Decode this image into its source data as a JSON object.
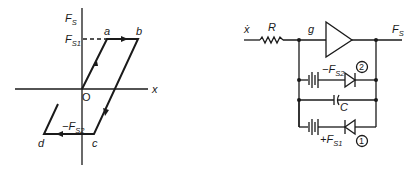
{
  "graph": {
    "y_axis_label": "F",
    "y_axis_sub": "S",
    "x_axis_label": "x",
    "origin_label": "O",
    "upper_level_label": "F",
    "upper_level_sub": "S1",
    "lower_level_label": "−F",
    "lower_level_sub": "S2",
    "points": {
      "a": "a",
      "b": "b",
      "c": "c",
      "d": "d"
    }
  },
  "circuit": {
    "input_label": "ẋ",
    "resistor_label": "R",
    "node_label": "g",
    "output_label": "F",
    "output_sub": "S",
    "branch2_source_label": "−F",
    "branch2_source_sub": "S2",
    "branch2_number": "2",
    "capacitor_label": "C",
    "branch1_source_label": "+F",
    "branch1_source_sub": "S1",
    "branch1_number": "1"
  }
}
